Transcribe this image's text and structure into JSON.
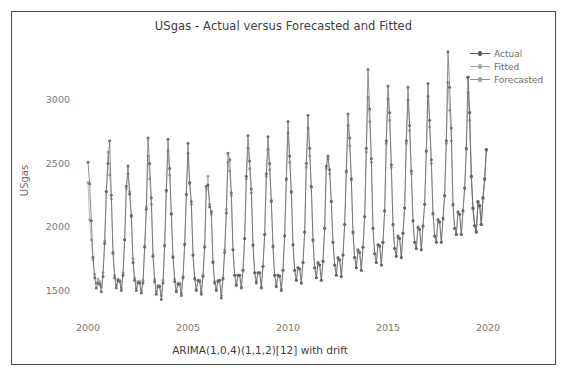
{
  "chart_data": {
    "type": "line",
    "title": "USgas - Actual versus Forecasted and Fitted",
    "xlabel": "ARIMA(1,0,4)(1,1,2)[12] with drift",
    "ylabel": "USgas",
    "xlim": [
      1999.6,
      2020.8
    ],
    "ylim": [
      1330,
      3420
    ],
    "xticks": [
      2000,
      2005,
      2010,
      2015,
      2020
    ],
    "yticks": [
      1500,
      2000,
      2500,
      3000
    ],
    "grid": false,
    "legend_position": "top-right",
    "legend": [
      "Actual",
      "Fitted",
      "Forecasted"
    ],
    "colors": {
      "actual": "#5a5a5a",
      "fitted": "#9aa79a",
      "forecasted": "#8f9a8f",
      "axis_text": "#7a7a7a",
      "title_text": "#3d3d3d",
      "frame": "#4a4a4a"
    },
    "x_start": 2000.0,
    "x_step": 0.08333,
    "series": [
      {
        "name": "Actual",
        "values": [
          2510,
          2340,
          2050,
          1760,
          1600,
          1520,
          1560,
          1550,
          1490,
          1610,
          1870,
          2280,
          2500,
          2680,
          2250,
          1800,
          1600,
          1520,
          1580,
          1570,
          1500,
          1620,
          1900,
          2320,
          2480,
          2260,
          2090,
          1720,
          1580,
          1500,
          1560,
          1560,
          1480,
          1560,
          1840,
          2140,
          2700,
          2500,
          2230,
          1770,
          1570,
          1470,
          1530,
          1530,
          1430,
          1560,
          1850,
          2290,
          2690,
          2460,
          2100,
          1760,
          1570,
          1490,
          1550,
          1550,
          1460,
          1600,
          1860,
          2260,
          2660,
          2350,
          2200,
          1780,
          1590,
          1500,
          1580,
          1570,
          1470,
          1610,
          1840,
          2320,
          2330,
          2160,
          2120,
          1720,
          1560,
          1500,
          1570,
          1580,
          1440,
          1590,
          1800,
          2110,
          2580,
          2530,
          2270,
          1820,
          1620,
          1540,
          1620,
          1620,
          1520,
          1660,
          1910,
          2400,
          2720,
          2520,
          2300,
          1860,
          1640,
          1560,
          1640,
          1640,
          1520,
          1690,
          1940,
          2420,
          2710,
          2500,
          2200,
          1850,
          1620,
          1530,
          1620,
          1610,
          1500,
          1660,
          1930,
          2380,
          2830,
          2560,
          2280,
          1860,
          1660,
          1580,
          1680,
          1670,
          1560,
          1720,
          1960,
          2500,
          2880,
          2620,
          2320,
          1900,
          1680,
          1600,
          1720,
          1700,
          1580,
          1730,
          1990,
          2480,
          2560,
          2450,
          2200,
          1880,
          1700,
          1620,
          1760,
          1740,
          1610,
          1780,
          2020,
          2440,
          2890,
          2700,
          2380,
          1960,
          1760,
          1680,
          1820,
          1800,
          1660,
          1840,
          2080,
          2620,
          3240,
          2930,
          2540,
          1990,
          1790,
          1720,
          1860,
          1850,
          1700,
          1880,
          2130,
          2680,
          3110,
          2900,
          2490,
          2020,
          1830,
          1770,
          1930,
          1910,
          1760,
          1950,
          2150,
          2680,
          3100,
          2800,
          2440,
          2050,
          1880,
          1830,
          2000,
          1980,
          1820,
          2010,
          2180,
          2600,
          3130,
          2840,
          2530,
          2110,
          1930,
          1880,
          2060,
          2040,
          1880,
          2070,
          2250,
          2680,
          3380,
          3100,
          2780,
          2180,
          1990,
          1940,
          2120,
          2100,
          1940,
          2130,
          2310,
          2620,
          3180,
          2900,
          2400,
          2150,
          2010,
          1960,
          2200,
          2170,
          2020,
          2230,
          2380,
          2610
        ]
      },
      {
        "name": "Fitted",
        "values": [
          2350,
          2060,
          1900,
          1740,
          1630,
          1560,
          1590,
          1570,
          1530,
          1640,
          1890,
          2280,
          2590,
          2410,
          2220,
          1790,
          1620,
          1540,
          1590,
          1580,
          1520,
          1640,
          1900,
          2300,
          2420,
          2280,
          2080,
          1750,
          1600,
          1520,
          1570,
          1570,
          1500,
          1580,
          1850,
          2160,
          2560,
          2380,
          2180,
          1780,
          1590,
          1490,
          1540,
          1540,
          1460,
          1580,
          1860,
          2280,
          2600,
          2410,
          2110,
          1770,
          1590,
          1500,
          1560,
          1560,
          1480,
          1610,
          1870,
          2250,
          2580,
          2340,
          2180,
          1780,
          1600,
          1510,
          1580,
          1580,
          1490,
          1620,
          1850,
          2300,
          2400,
          2180,
          2100,
          1730,
          1570,
          1510,
          1580,
          1580,
          1460,
          1600,
          1820,
          2140,
          2510,
          2440,
          2250,
          1820,
          1620,
          1550,
          1620,
          1620,
          1530,
          1660,
          1910,
          2380,
          2620,
          2460,
          2270,
          1850,
          1640,
          1570,
          1640,
          1640,
          1530,
          1690,
          1940,
          2400,
          2610,
          2450,
          2210,
          1840,
          1620,
          1540,
          1620,
          1620,
          1510,
          1660,
          1930,
          2370,
          2740,
          2510,
          2270,
          1860,
          1660,
          1580,
          1680,
          1670,
          1560,
          1720,
          1960,
          2470,
          2780,
          2560,
          2310,
          1890,
          1680,
          1600,
          1710,
          1700,
          1580,
          1730,
          1990,
          2460,
          2540,
          2420,
          2200,
          1880,
          1700,
          1620,
          1750,
          1740,
          1610,
          1780,
          2020,
          2430,
          2800,
          2640,
          2370,
          1950,
          1760,
          1680,
          1810,
          1800,
          1660,
          1840,
          2080,
          2590,
          3020,
          2830,
          2510,
          1990,
          1790,
          1720,
          1860,
          1850,
          1700,
          1880,
          2120,
          2660,
          3010,
          2840,
          2470,
          2020,
          1830,
          1770,
          1920,
          1910,
          1760,
          1950,
          2150,
          2660,
          3000,
          2760,
          2420,
          2050,
          1880,
          1830,
          1990,
          1980,
          1820,
          2000,
          2180,
          2590,
          3030,
          2790,
          2500,
          2100,
          1930,
          1880,
          2050,
          2040,
          1880,
          2060,
          2240,
          2660,
          3140,
          2920,
          2680,
          2170,
          1990,
          1940,
          2110,
          2100,
          1940,
          2120,
          2300,
          2610,
          3060,
          2840,
          2390,
          2140,
          2010,
          1960,
          2190,
          2160,
          2020,
          2220,
          2370,
          2600
        ]
      },
      {
        "name": "Forecasted",
        "start_index": 228,
        "values": [
          3180,
          2900,
          2400,
          2150,
          2010,
          1960,
          2200,
          2170,
          2020,
          2230,
          2380,
          2610
        ]
      }
    ]
  },
  "legend": {
    "items": [
      {
        "label": "Actual",
        "color": "#5a5a5a"
      },
      {
        "label": "Fitted",
        "color": "#9aa79a"
      },
      {
        "label": "Forecasted",
        "color": "#8f9a8f"
      }
    ]
  }
}
